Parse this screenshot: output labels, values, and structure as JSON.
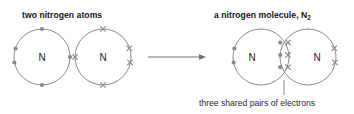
{
  "diagram": {
    "left_title": "two nitrogen atoms",
    "right_title_text": "a nitrogen molecule, N",
    "right_title_sub": "2",
    "caption": "three shared pairs of electrons",
    "atom_symbol_1": "N",
    "atom_symbol_2": "N",
    "molecule_symbol_1": "N",
    "molecule_symbol_2": "N",
    "colors": {
      "stroke": "#7d7d7d",
      "electron": "#8a8a8a",
      "text": "#141414",
      "caption": "#2a2a2a",
      "background": "#ffffff"
    },
    "geometry": {
      "atom1_center_x": 42,
      "atom1_center_y": 57,
      "atom_radius": 28,
      "atom2_center_x": 103,
      "atom2_center_y": 57,
      "arrow_start_x": 148,
      "arrow_end_x": 206,
      "arrow_y": 57,
      "mol1_center_x": 261,
      "mol2_center_x": 308,
      "mol_center_y": 57,
      "mol_radius": 28,
      "lens_center_x": 284,
      "leader_x": 284,
      "leader_top_y": 80,
      "leader_bottom_y": 95
    },
    "electrons": {
      "atom1_type": "dot",
      "atom1_count": 5,
      "atom1_description": "one dot at top, one at bottom, one at right, lone pair of two dots at left",
      "atom2_type": "cross",
      "atom2_count": 5,
      "atom2_description": "one cross at top, one at bottom, one at left, lone pair of two crosses at right",
      "molecule_lone_pair_left_type": "dot",
      "molecule_lone_pair_left_count": 2,
      "molecule_lone_pair_right_type": "cross",
      "molecule_lone_pair_right_count": 2,
      "shared_pairs": 3,
      "shared_pair_description": "three rows in the overlap lens, each row one dot and one cross"
    }
  }
}
